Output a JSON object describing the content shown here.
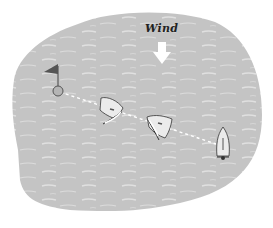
{
  "diagram": {
    "type": "sailing-illustration",
    "wind_label": "Wind",
    "colors": {
      "water": "#c4c4c4",
      "water_highlight": "#e2e2e2",
      "boat_fill": "#ebebeb",
      "outline": "#333333",
      "flag": "#555555",
      "arrow": "#ffffff",
      "course_line": "#ffffff"
    },
    "elements": [
      {
        "id": "wind-arrow",
        "direction": "down"
      },
      {
        "id": "mark-buoy",
        "has_flag": true
      },
      {
        "id": "boat-1",
        "heading": "left-tacking"
      },
      {
        "id": "boat-2",
        "heading": "left-tacking"
      },
      {
        "id": "boat-3",
        "heading": "up"
      }
    ]
  }
}
